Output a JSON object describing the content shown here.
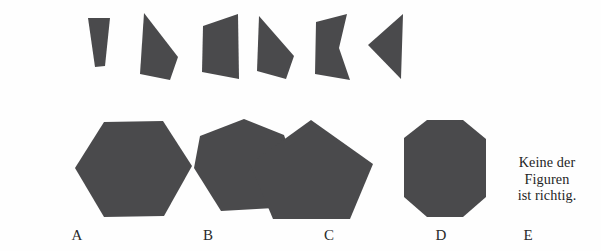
{
  "page": {
    "language": "de",
    "background_color": "#fefefe",
    "shape_fill_color": "#4a4a4c",
    "text_color": "#1f1f1f",
    "width": 601,
    "height": 251
  },
  "puzzle": {
    "type": "shape-assembly-multiple-choice",
    "fragment_count": 6,
    "option_count": 5
  },
  "fragments": [
    {
      "id": "fragment-1",
      "name": "narrow-tapered-wedge",
      "points": "88,18 110,18 105,66 95,67",
      "description": "narrow trapezoid wider at top tapering downward"
    },
    {
      "id": "fragment-2",
      "name": "pointed-quadrilateral-right",
      "points": "144,13 178,57 170,80 140,74",
      "description": "quadrilateral with apex at upper-left widening to a point on the right"
    },
    {
      "id": "fragment-3",
      "name": "slanted-trapezoid",
      "points": "203,26 238,14 239,79 202,72",
      "description": "quadrilateral with taller right edge than left edge"
    },
    {
      "id": "fragment-4",
      "name": "pointed-quadrilateral-right-2",
      "points": "259,16 294,56 286,79 257,71",
      "description": "quadrilateral with apex at upper-left widening to a point on the right"
    },
    {
      "id": "fragment-5",
      "name": "concave-notched-quadrilateral",
      "points": "316,22 347,14 339,48 350,80 315,74",
      "description": "quadrilateral with a concave notch on the right side"
    },
    {
      "id": "fragment-6",
      "name": "left-pointing-triangle",
      "points": "403,14 401,79 368,45",
      "description": "triangular wedge pointing to the left"
    }
  ],
  "options": [
    {
      "key": "A",
      "label": "A",
      "shape_name": "hexagon",
      "sides": 6,
      "label_x": 77,
      "label_y": 228,
      "points": "75,168 104,122 163,121 192,166 164,216 104,217"
    },
    {
      "key": "B",
      "label": "B",
      "shape_name": "heptagon",
      "sides": 7,
      "label_x": 208,
      "label_y": 228,
      "points": "194,168 200,136 244,119 284,135 296,171 274,208 221,211"
    },
    {
      "key": "C",
      "label": "C",
      "shape_name": "pentagon",
      "sides": 5,
      "label_x": 329,
      "label_y": 228,
      "points": "311,120 373,164 350,219 273,219 250,164"
    },
    {
      "key": "D",
      "label": "D",
      "shape_name": "octagon",
      "sides": 8,
      "label_x": 441,
      "label_y": 228,
      "points": "404,138 427,120 463,120 486,139 486,197 463,217 427,217 404,197"
    },
    {
      "key": "E",
      "label": "E",
      "shape_name": "none-of-the-above",
      "sides": 0,
      "label_x": 528,
      "label_y": 228,
      "points": ""
    }
  ],
  "option_e": {
    "line1": "Keine der",
    "line2": "Figuren",
    "line3": "ist richtig."
  }
}
